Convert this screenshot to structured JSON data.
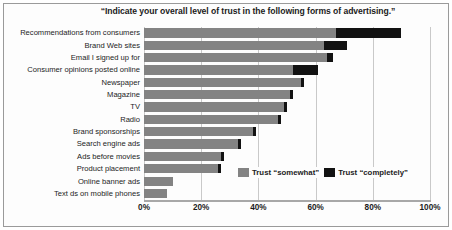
{
  "chart_data": {
    "type": "bar",
    "orientation": "horizontal",
    "stacked": true,
    "title": "“Indicate your overall level of trust in the following forms of advertising.”",
    "xlabel": "",
    "ylabel": "",
    "xlim": [
      0,
      100
    ],
    "xticks": [
      "0%",
      "20%",
      "40%",
      "60%",
      "80%",
      "100%"
    ],
    "xtick_values": [
      0,
      20,
      40,
      60,
      80,
      100
    ],
    "grid": true,
    "legend_position": "inside-bottom-right",
    "categories": [
      "Recommendations from consumers",
      "Brand Web sites",
      "Email I signed up for",
      "Consumer opinions posted online",
      "Newspaper",
      "Magazine",
      "TV",
      "Radio",
      "Brand sponsorships",
      "Search engine ads",
      "Ads before movies",
      "Product placement",
      "Online banner ads",
      "Text ds on mobile phones"
    ],
    "series": [
      {
        "name": "Trust “somewhat”",
        "color": "#838383",
        "values": [
          67,
          63,
          64,
          52,
          55,
          51,
          49,
          47,
          38,
          33,
          27,
          26,
          10,
          8
        ]
      },
      {
        "name": "Trust “completely”",
        "color": "#121212",
        "values": [
          23,
          8,
          2,
          9,
          1,
          1,
          1,
          1,
          1,
          1,
          1,
          1,
          0,
          0
        ]
      }
    ],
    "totals": [
      90,
      71,
      66,
      61,
      56,
      52,
      50,
      48,
      39,
      34,
      28,
      27,
      10,
      8
    ]
  },
  "legend": {
    "items": [
      {
        "label": "Trust “somewhat”",
        "color": "#838383"
      },
      {
        "label": "Trust “completely”",
        "color": "#121212"
      }
    ]
  }
}
